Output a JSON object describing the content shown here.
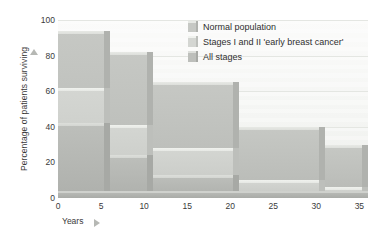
{
  "chart_data": {
    "type": "area",
    "title": "",
    "subtitle": "",
    "xlabel": "Years",
    "ylabel": "Percentage of patients surviving",
    "xlim": [
      0,
      36
    ],
    "ylim": [
      0,
      100
    ],
    "xticks": [
      0,
      5,
      10,
      15,
      20,
      25,
      30,
      35
    ],
    "yticks": [
      0,
      20,
      40,
      60,
      80,
      100
    ],
    "xtick_labels": [
      "0",
      "5",
      "10",
      "15",
      "20",
      "25",
      "30",
      "35"
    ],
    "ytick_labels": [
      "0",
      "20",
      "40",
      "60",
      "80",
      "100"
    ],
    "grid": true,
    "legend_position": "top-right",
    "style": "3d-stepped-area",
    "step_edges": [
      0,
      6,
      11,
      21,
      31,
      36
    ],
    "series": [
      {
        "name": "Normal population",
        "color": "#c6c8c4",
        "top_color": "#e7e9e5",
        "side_color": "#b0b2ae",
        "values": [
          94,
          82,
          65,
          40,
          30
        ],
        "steps": [
          {
            "x0": 0,
            "x1": 6,
            "value": 94
          },
          {
            "x0": 6,
            "x1": 11,
            "value": 82
          },
          {
            "x0": 11,
            "x1": 21,
            "value": 65
          },
          {
            "x0": 21,
            "x1": 31,
            "value": 40
          },
          {
            "x0": 31,
            "x1": 36,
            "value": 30
          }
        ]
      },
      {
        "name": "Stages I and II 'early breast cancer'",
        "color": "#d4d6d2",
        "top_color": "#f0f2ee",
        "side_color": "#bdbfbb",
        "values": [
          62,
          41,
          28,
          10,
          6
        ],
        "steps": [
          {
            "x0": 0,
            "x1": 6,
            "value": 62
          },
          {
            "x0": 6,
            "x1": 11,
            "value": 41
          },
          {
            "x0": 11,
            "x1": 21,
            "value": 28
          },
          {
            "x0": 21,
            "x1": 31,
            "value": 10
          },
          {
            "x0": 31,
            "x1": 36,
            "value": 6
          }
        ]
      },
      {
        "name": "All stages",
        "color": "#bdbfbb",
        "top_color": "#dddfdb",
        "side_color": "#a7a9a5",
        "values": [
          42,
          24,
          13,
          4,
          4
        ],
        "steps": [
          {
            "x0": 0,
            "x1": 6,
            "value": 42
          },
          {
            "x0": 6,
            "x1": 11,
            "value": 24
          },
          {
            "x0": 11,
            "x1": 21,
            "value": 13
          },
          {
            "x0": 21,
            "x1": 31,
            "value": 4
          },
          {
            "x0": 31,
            "x1": 36,
            "value": 4
          }
        ]
      }
    ]
  },
  "legend": {
    "items": [
      {
        "label": "Normal population"
      },
      {
        "label": "Stages I and II 'early breast cancer'"
      },
      {
        "label": "All stages"
      }
    ]
  },
  "axis": {
    "y_title": "Percentage of patients surviving",
    "x_title": "Years"
  }
}
